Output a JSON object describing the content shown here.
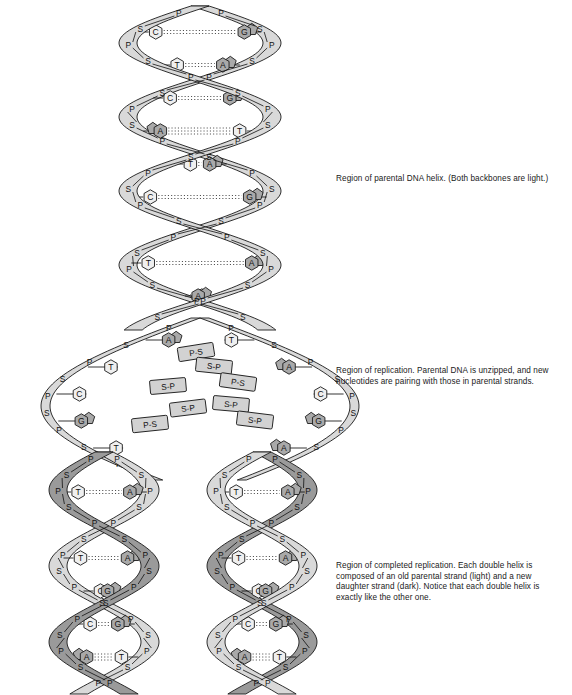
{
  "figure": {
    "background": "#ffffff",
    "colors": {
      "backbone_light": "#d9d9d9",
      "backbone_dark": "#9a9a9a",
      "base_light": "#efefef",
      "base_dark": "#a9a9a9",
      "sugar_tag": "#c9c9c9",
      "free_nucleotide": "#d2d2d2",
      "outline": "#1a1a1a",
      "hbond": "#333333",
      "text": "#1a1a1a"
    },
    "labels": {
      "phosphate": "P",
      "sugar": "S",
      "adenine": "A",
      "thymine": "T",
      "guanine": "G",
      "cytosine": "C",
      "free_sp": "S-P",
      "free_ps": "P-S"
    }
  },
  "captions": [
    {
      "id": "parental",
      "name": "caption-parental-helix",
      "text": "Region of parental DNA helix. (Both backbones are light.)"
    },
    {
      "id": "replication",
      "name": "caption-replication",
      "text": "Region of replication. Parental DNA is unzipped, and new nucleotides are pairing with those in parental strands."
    },
    {
      "id": "complete",
      "name": "caption-completed-replication",
      "text": "Region of completed replication. Each double helix is composed of an old parental strand (light) and a new daughter strand (dark). Notice that each double helix is exactly like the other one."
    }
  ],
  "diagram_data": {
    "type": "diagram",
    "subject": "semiconservative DNA replication",
    "regions": [
      {
        "id": "parental",
        "y_range": [
          0,
          320
        ],
        "left_strand_shade": "light",
        "right_strand_shade": "light",
        "base_pairs": [
          {
            "left": "C",
            "right": "G"
          },
          {
            "left": "T",
            "right": "A"
          },
          {
            "left": "C",
            "right": "G"
          },
          {
            "left": "A",
            "right": "T"
          },
          {
            "left": "T",
            "right": "A"
          },
          {
            "left": "C",
            "right": "G"
          },
          {
            "left": "G",
            "right": "C"
          },
          {
            "left": "T",
            "right": "A"
          },
          {
            "left": "T",
            "right": "A"
          }
        ]
      },
      {
        "id": "replication",
        "y_range": [
          320,
          470
        ],
        "description": "unzipped bubble with unpaired parental bases and free floating nucleotides",
        "left_parent_bases": [
          "A",
          "T",
          "C",
          "G",
          "T"
        ],
        "right_parent_bases": [
          "T",
          "A",
          "C",
          "G",
          "A"
        ],
        "free_nucleotides": [
          "P-S",
          "S-P",
          "S-P",
          "P-S",
          "S-P",
          "S-P",
          "P-S",
          "S-P"
        ]
      },
      {
        "id": "completed-left",
        "y_range": [
          470,
          695
        ],
        "left_strand_shade": "dark",
        "right_strand_shade": "light",
        "base_pairs": [
          {
            "left": "T",
            "right": "A"
          },
          {
            "left": "G",
            "right": "C"
          },
          {
            "left": "T",
            "right": "A"
          },
          {
            "left": "C",
            "right": "G"
          },
          {
            "left": "C",
            "right": "G"
          },
          {
            "left": "A",
            "right": "T"
          }
        ]
      },
      {
        "id": "completed-right",
        "y_range": [
          470,
          695
        ],
        "left_strand_shade": "light",
        "right_strand_shade": "dark",
        "base_pairs": [
          {
            "left": "T",
            "right": "A"
          },
          {
            "left": "G",
            "right": "C"
          },
          {
            "left": "T",
            "right": "A"
          },
          {
            "left": "C",
            "right": "G"
          },
          {
            "left": "C",
            "right": "G"
          },
          {
            "left": "A",
            "right": "T"
          }
        ]
      }
    ]
  }
}
